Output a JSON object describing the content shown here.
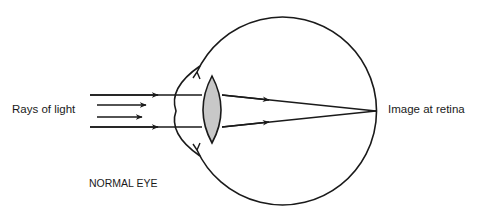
{
  "diagram": {
    "title": "NORMAL EYE",
    "labels": {
      "rays": "Rays of light",
      "image": "Image at retina"
    },
    "colors": {
      "stroke": "#1a1a1a",
      "lens_fill": "#c8c8c8",
      "background": "#ffffff"
    },
    "parts": [
      "eyeball",
      "cornea",
      "lens",
      "incoming-rays",
      "refracted-rays",
      "focal-point"
    ]
  }
}
